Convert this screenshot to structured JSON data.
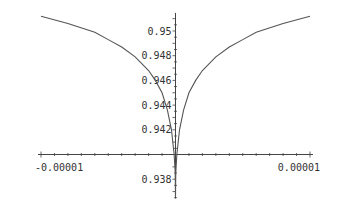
{
  "chart_data": {
    "type": "line",
    "title": "",
    "xlabel": "",
    "ylabel": "",
    "xlim": [
      -1e-05,
      1e-05
    ],
    "ylim": [
      0.9366,
      0.9513
    ],
    "axis_origin": {
      "x": 0,
      "y": 0.94
    },
    "x_tick_labels": [
      {
        "value": -1e-05,
        "label": "-0.00001"
      },
      {
        "value": 1e-05,
        "label": "0.00001"
      }
    ],
    "y_tick_labels": [
      {
        "value": 0.95,
        "label": "0.95"
      },
      {
        "value": 0.948,
        "label": "0.948"
      },
      {
        "value": 0.946,
        "label": "0.946"
      },
      {
        "value": 0.944,
        "label": "0.944"
      },
      {
        "value": 0.942,
        "label": "0.942"
      },
      {
        "value": 0.938,
        "label": "0.938"
      }
    ],
    "series": [
      {
        "name": "f(x)",
        "x": [
          -1e-05,
          -8e-06,
          -6e-06,
          -5e-06,
          -4e-06,
          -3e-06,
          -2e-06,
          -1.5e-06,
          -1e-06,
          -6e-07,
          -3e-07,
          -1e-07,
          -2e-08,
          0,
          2e-08,
          1e-07,
          3e-07,
          6e-07,
          1e-06,
          1.5e-06,
          2e-06,
          3e-06,
          4e-06,
          5e-06,
          6e-06,
          8e-06,
          1e-05
        ],
        "y": [
          0.9512,
          0.9506,
          0.9499,
          0.9493,
          0.9487,
          0.9479,
          0.9468,
          0.946,
          0.945,
          0.9436,
          0.942,
          0.94,
          0.9385,
          0.9366,
          0.9385,
          0.94,
          0.942,
          0.9436,
          0.945,
          0.946,
          0.9468,
          0.9479,
          0.9487,
          0.9493,
          0.9499,
          0.9506,
          0.9512
        ]
      }
    ],
    "grid": false,
    "legend": "none"
  }
}
